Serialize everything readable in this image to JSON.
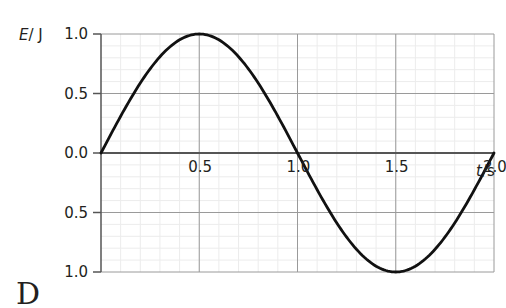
{
  "chart_data": {
    "type": "line",
    "title": "",
    "xlabel": "t/s",
    "ylabel": "E/J",
    "xlabel_var": "t",
    "xlabel_unit": "s",
    "ylabel_var": "E",
    "ylabel_unit": "J",
    "xlim": [
      0,
      2.0
    ],
    "ylim": [
      -1.0,
      1.0
    ],
    "x_ticks": [
      0.5,
      1.0,
      1.5,
      2.0
    ],
    "x_tick_labels": [
      "0.5",
      "1.0",
      "1.5",
      "2.0"
    ],
    "y_ticks": [
      1.0,
      0.5,
      0.0,
      -0.5,
      -1.0
    ],
    "y_tick_labels": [
      "1.0",
      "0.5",
      "0.0",
      "0.5",
      "1.0"
    ],
    "grid": true,
    "minor_grid": true,
    "legend": null,
    "series": [
      {
        "name": "E",
        "function": "sin(pi * t)",
        "x": [
          0,
          0.1,
          0.2,
          0.3,
          0.4,
          0.5,
          0.6,
          0.7,
          0.8,
          0.9,
          1.0,
          1.1,
          1.2,
          1.3,
          1.4,
          1.5,
          1.6,
          1.7,
          1.8,
          1.9,
          2.0
        ],
        "values": [
          0.0,
          0.31,
          0.59,
          0.81,
          0.95,
          1.0,
          0.95,
          0.81,
          0.59,
          0.31,
          0.0,
          -0.31,
          -0.59,
          -0.81,
          -0.95,
          -1.0,
          -0.95,
          -0.81,
          -0.59,
          -0.31,
          0.0
        ],
        "color": "#111111"
      }
    ]
  },
  "colors": {
    "curve": "#111111",
    "axis": "#555555",
    "major_grid": "#9a9a9a",
    "minor_grid": "#ececec",
    "text": "#231f20"
  },
  "option_letter": "D"
}
